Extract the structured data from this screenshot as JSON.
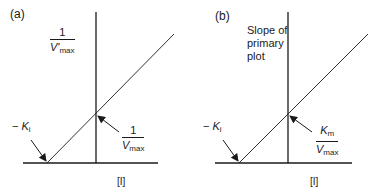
{
  "panels": [
    {
      "id": "a",
      "label": "(a)",
      "y_axis_label": {
        "numerator": "1",
        "denominator_var": "V'",
        "denominator_sub": "max"
      },
      "x_axis_label": "[I]",
      "x_intercept_label": {
        "prefix": "− ",
        "var": "K",
        "sub": "i"
      },
      "y_intercept_label": {
        "numerator": "1",
        "denominator_var": "V",
        "denominator_sub": "max"
      }
    },
    {
      "id": "b",
      "label": "(b)",
      "y_axis_label": {
        "line1": "Slope of",
        "line2": "primary",
        "line3": "plot"
      },
      "x_axis_label": "[I]",
      "x_intercept_label": {
        "prefix": "− ",
        "var": "K",
        "sub": "i"
      },
      "y_intercept_label": {
        "numerator_var": "K",
        "numerator_sub": "m",
        "denominator_var": "V",
        "denominator_sub": "max"
      }
    }
  ],
  "colors": {
    "line": "#1a1a1a",
    "background": "#ffffff"
  }
}
